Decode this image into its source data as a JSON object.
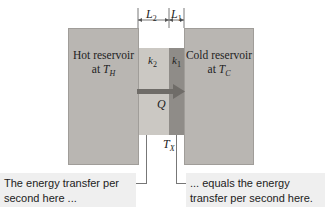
{
  "hot_reservoir": {
    "line1": "Hot reservoir",
    "line2_prefix": "at ",
    "symbol": "T",
    "subscript": "H"
  },
  "cold_reservoir": {
    "line1": "Cold reservoir",
    "line2_prefix": "at ",
    "symbol": "T",
    "subscript": "C"
  },
  "slab2": {
    "label": "k",
    "subscript": "2",
    "length_label": "L",
    "length_sub": "2"
  },
  "slab1": {
    "label": "k",
    "subscript": "1",
    "length_label": "L",
    "length_sub": "1"
  },
  "heat_flow": {
    "label": "Q"
  },
  "interface_temp": {
    "symbol": "T",
    "subscript": "X"
  },
  "captions": {
    "left": [
      "The energy transfer per",
      "second here ..."
    ],
    "right": [
      "... equals the energy",
      "transfer per second here."
    ]
  },
  "colors": {
    "reservoir": "#b9b6b2",
    "k2": "#cbc8c3",
    "k1": "#8f8c88",
    "arrow": "#6f6c68",
    "caption_bg": "#efefef"
  }
}
